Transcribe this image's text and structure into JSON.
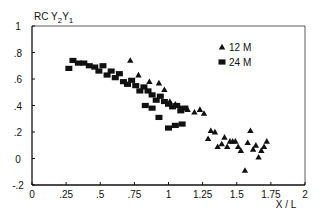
{
  "chart_data": {
    "type": "scatter",
    "title": "",
    "ylabel": "RC Y2Y1",
    "ylabel_parts": {
      "main": "RC ",
      "y2": "Y",
      "sub2": "2",
      "y1": "Y",
      "sub1": "1"
    },
    "xlabel": "X / L",
    "xlim": [
      0,
      2
    ],
    "ylim": [
      -0.2,
      1
    ],
    "grid": false,
    "legend_position": "upper right",
    "x_ticks": [
      {
        "value": 0,
        "label": "0"
      },
      {
        "value": 0.25,
        "label": ".25"
      },
      {
        "value": 0.5,
        "label": ".5"
      },
      {
        "value": 0.75,
        "label": ".75"
      },
      {
        "value": 1,
        "label": "1"
      },
      {
        "value": 1.25,
        "label": "1.25"
      },
      {
        "value": 1.5,
        "label": "1.5"
      },
      {
        "value": 1.75,
        "label": "1.75"
      },
      {
        "value": 2,
        "label": "2"
      }
    ],
    "y_ticks": [
      {
        "value": 1,
        "label": "1"
      },
      {
        "value": 0.8,
        "label": ".8"
      },
      {
        "value": 0.6,
        "label": ".6"
      },
      {
        "value": 0.4,
        "label": ".4"
      },
      {
        "value": 0.2,
        "label": ".2"
      },
      {
        "value": 0,
        "label": "0"
      },
      {
        "value": -0.2,
        "label": "-.2"
      }
    ],
    "series": [
      {
        "name": "12 M",
        "marker": "triangle",
        "color": "#111111",
        "x": [
          0.72,
          0.78,
          0.86,
          0.93,
          0.97,
          1.01,
          1.05,
          1.09,
          1.14,
          1.19,
          1.23,
          1.26,
          1.29,
          1.31,
          1.34,
          1.36,
          1.39,
          1.41,
          1.43,
          1.45,
          1.47,
          1.49,
          1.51,
          1.53,
          1.56,
          1.58,
          1.6,
          1.62,
          1.64,
          1.66,
          1.68,
          1.7,
          1.72
        ],
        "y": [
          0.74,
          0.63,
          0.58,
          0.57,
          0.52,
          0.43,
          0.41,
          0.38,
          0.37,
          0.35,
          0.37,
          0.34,
          0.15,
          0.21,
          0.2,
          0.09,
          0.11,
          0.16,
          0.09,
          0.13,
          0.13,
          0.13,
          0.09,
          0.06,
          -0.09,
          0.12,
          0.21,
          0.07,
          0.1,
          0.01,
          0.06,
          0.09,
          0.13
        ]
      },
      {
        "name": "24 M",
        "marker": "square",
        "color": "#111111",
        "x": [
          0.27,
          0.3,
          0.34,
          0.38,
          0.42,
          0.46,
          0.49,
          0.52,
          0.55,
          0.58,
          0.61,
          0.64,
          0.67,
          0.7,
          0.73,
          0.76,
          0.79,
          0.82,
          0.85,
          0.88,
          0.91,
          0.94,
          0.97,
          1.0,
          1.03,
          1.06,
          1.09,
          1.12,
          0.83,
          0.88,
          0.93,
          1.0,
          1.05,
          1.1
        ],
        "y": [
          0.68,
          0.74,
          0.72,
          0.72,
          0.7,
          0.69,
          0.66,
          0.7,
          0.63,
          0.66,
          0.61,
          0.64,
          0.58,
          0.56,
          0.59,
          0.55,
          0.51,
          0.54,
          0.51,
          0.48,
          0.44,
          0.47,
          0.43,
          0.41,
          0.39,
          0.4,
          0.36,
          0.38,
          0.4,
          0.38,
          0.31,
          0.23,
          0.25,
          0.26
        ]
      }
    ]
  }
}
